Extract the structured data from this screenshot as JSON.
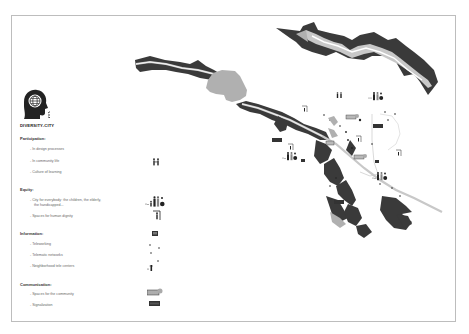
{
  "title": "DIVERSITY-CITY",
  "legend": {
    "sections": [
      {
        "label": "Participation:",
        "items": [
          {
            "label": "- In design processes",
            "icon": ""
          },
          {
            "label": "- In community life",
            "icon": "people-pair-icon"
          },
          {
            "label": "- Culture of learning",
            "icon": ""
          }
        ]
      },
      {
        "label": "Equity:",
        "items": [
          {
            "label": "- City for everybody: the children, the elderly,",
            "label2": "the handicapped...",
            "icon": "family-group-icon"
          },
          {
            "label": "- Spaces for human dignity",
            "icon": "person-shelter-icon"
          }
        ]
      },
      {
        "label": "Information:",
        "items": [
          {
            "label": "- Teleworking",
            "icon": "laptop-icon"
          },
          {
            "label": "- Telematic networks",
            "icon": "network-dots-icon"
          },
          {
            "label": "- Neighborhood tele centers",
            "icon": "telecenter-icon"
          }
        ]
      },
      {
        "label": "Communication:",
        "items": [
          {
            "label": "- Spaces for the community",
            "icon": "community-space-icon"
          },
          {
            "label": "- Signalization",
            "icon": "sign-icon"
          }
        ]
      }
    ]
  },
  "colors": {
    "dark": "#3a3a3a",
    "gray": "#b0b0b0",
    "river": "#c8c8c8",
    "frame": "#bdbdbd"
  }
}
